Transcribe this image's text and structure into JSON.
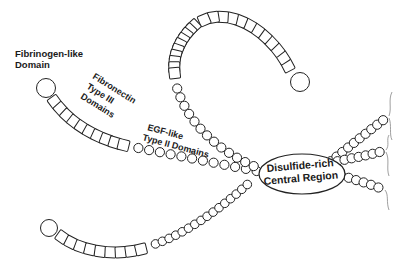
{
  "diagram": {
    "type": "protein-domain-schematic",
    "background": "#ffffff",
    "stroke_color": "#222222",
    "labels": {
      "fibrinogen": {
        "line1": "Fibrinogen-like",
        "line2": "Domain"
      },
      "fibronectin": {
        "line1": "Fibronectin",
        "line2": "Type III",
        "line3": "Domains"
      },
      "egf": {
        "line1": "EGF-like",
        "line2": "Type II Domains"
      },
      "central": {
        "line1": "Disulfide-rich",
        "line2": "Central Region"
      }
    },
    "arms": [
      {
        "name": "upper-left-arm",
        "terminal": "fibrinogen-like-circle",
        "fn3_squares": 10,
        "egf_beads": 12
      },
      {
        "name": "top-arc-arm",
        "terminal": "fibrinogen-like-circle",
        "fn3_squares": 22,
        "egf_beads": 13
      },
      {
        "name": "lower-left-arm",
        "terminal": "fibrinogen-like-circle",
        "fn3_squares": 9,
        "egf_beads": 16
      },
      {
        "name": "right-upper-arm",
        "terminal": "truncated",
        "egf_beads": 11
      },
      {
        "name": "right-middle-arm",
        "terminal": "truncated",
        "egf_beads": 7
      },
      {
        "name": "right-lower-arm",
        "terminal": "truncated",
        "egf_beads": 7
      }
    ]
  }
}
